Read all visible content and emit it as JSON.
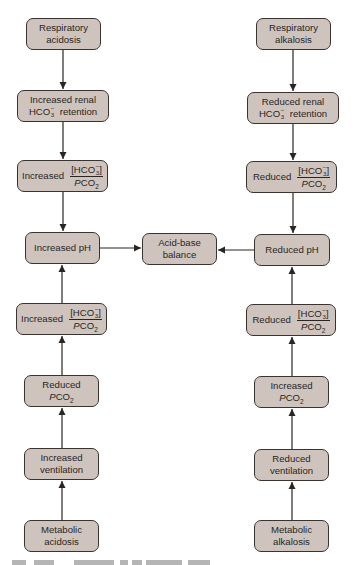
{
  "diagram": {
    "type": "flowchart",
    "colors": {
      "node_fill": "#cfc4bd",
      "node_border": "#3a3430",
      "arrow": "#2a2522",
      "background": "#ffffff"
    },
    "center": {
      "id": "acid_base_balance",
      "lines": [
        "Acid-base",
        "balance"
      ]
    },
    "left": {
      "respiratory_acidosis": {
        "lines": [
          "Respiratory",
          "acidosis"
        ]
      },
      "renal": {
        "line1": "Increased renal",
        "hco3": "HCO",
        "sub": "3",
        "sup": "−",
        "suffix": "retention"
      },
      "ratio_top": {
        "label": "Increased",
        "numerator": "[HCO",
        "num_sub": "3",
        "num_sup": "−",
        "num_close": "]",
        "denominator_p": "P",
        "denominator": "CO",
        "den_sub": "2"
      },
      "ph": {
        "label": "Increased pH"
      },
      "ratio_bottom": {
        "label": "Increased",
        "numerator": "[HCO",
        "num_sub": "3",
        "num_sup": "−",
        "num_close": "]",
        "denominator_p": "P",
        "denominator": "CO",
        "den_sub": "2"
      },
      "pco2": {
        "line1": "Reduced",
        "p": "P",
        "co": "CO",
        "sub": "2"
      },
      "ventilation": {
        "lines": [
          "Increased",
          "ventilation"
        ]
      },
      "metabolic_acidosis": {
        "lines": [
          "Metabolic",
          "acidosis"
        ]
      }
    },
    "right": {
      "respiratory_alkalosis": {
        "lines": [
          "Respiratory",
          "alkalosis"
        ]
      },
      "renal": {
        "line1": "Reduced renal",
        "hco3": "HCO",
        "sub": "3",
        "sup": "−",
        "suffix": "retention"
      },
      "ratio_top": {
        "label": "Reduced",
        "numerator": "[HCO",
        "num_sub": "3",
        "num_sup": "−",
        "num_close": "]",
        "denominator_p": "P",
        "denominator": "CO",
        "den_sub": "2"
      },
      "ph": {
        "label": "Reduced pH"
      },
      "ratio_bottom": {
        "label": "Reduced",
        "numerator": "[HCO",
        "num_sub": "3",
        "num_sup": "−",
        "num_close": "]",
        "denominator_p": "P",
        "denominator": "CO",
        "den_sub": "2"
      },
      "pco2": {
        "line1": "Increased",
        "p": "P",
        "co": "CO",
        "sub": "2"
      },
      "ventilation": {
        "lines": [
          "Reduced",
          "ventilation"
        ]
      },
      "metabolic_alkalosis": {
        "lines": [
          "Metabolic",
          "alkalosis"
        ]
      }
    },
    "edges": [
      {
        "from": "Respiratory acidosis",
        "to": "Increased renal HCO3- retention"
      },
      {
        "from": "Increased renal HCO3- retention",
        "to": "Increased [HCO3-]/PCO2 (top)"
      },
      {
        "from": "Increased [HCO3-]/PCO2 (top)",
        "to": "Increased pH"
      },
      {
        "from": "Metabolic acidosis",
        "to": "Increased ventilation"
      },
      {
        "from": "Increased ventilation",
        "to": "Reduced PCO2"
      },
      {
        "from": "Reduced PCO2",
        "to": "Increased [HCO3-]/PCO2 (bottom)"
      },
      {
        "from": "Increased [HCO3-]/PCO2 (bottom)",
        "to": "Increased pH"
      },
      {
        "from": "Increased pH",
        "to": "Acid-base balance"
      },
      {
        "from": "Respiratory alkalosis",
        "to": "Reduced renal HCO3- retention"
      },
      {
        "from": "Reduced renal HCO3- retention",
        "to": "Reduced [HCO3-]/PCO2 (top)"
      },
      {
        "from": "Reduced [HCO3-]/PCO2 (top)",
        "to": "Reduced pH"
      },
      {
        "from": "Metabolic alkalosis",
        "to": "Reduced ventilation"
      },
      {
        "from": "Reduced ventilation",
        "to": "Increased PCO2"
      },
      {
        "from": "Increased PCO2",
        "to": "Reduced [HCO3-]/PCO2 (bottom)"
      },
      {
        "from": "Reduced [HCO3-]/PCO2 (bottom)",
        "to": "Reduced pH"
      },
      {
        "from": "Reduced pH",
        "to": "Acid-base balance"
      }
    ]
  }
}
